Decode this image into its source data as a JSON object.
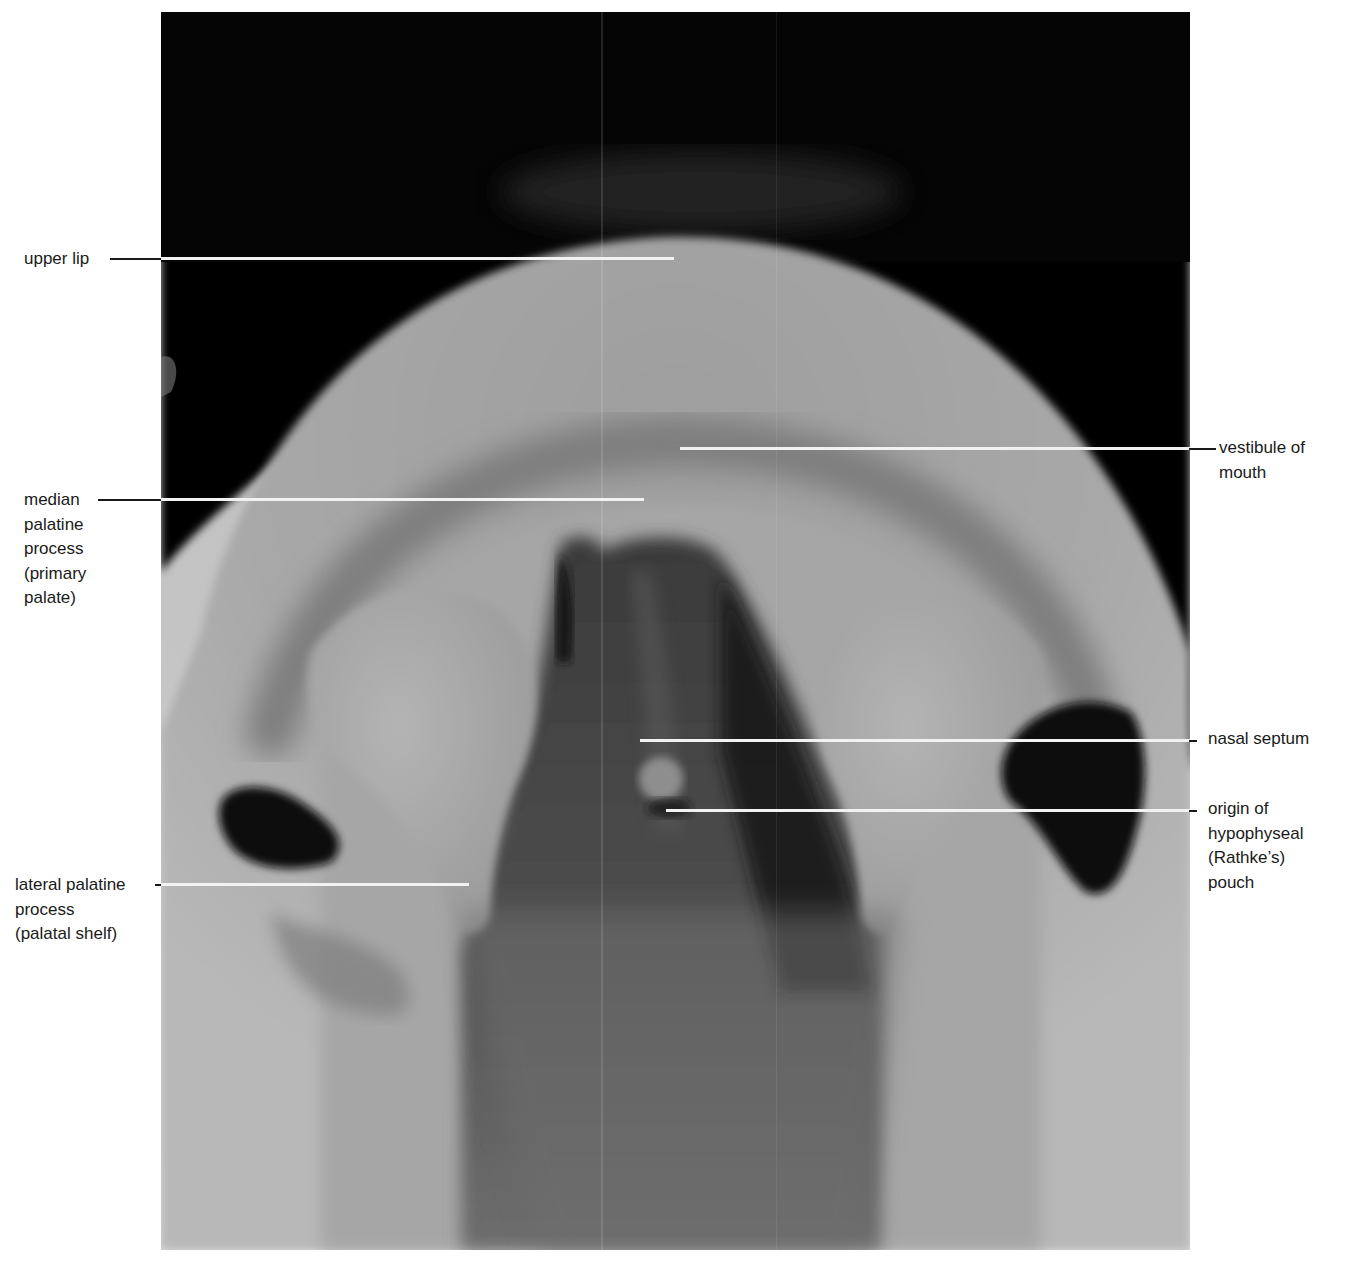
{
  "figure": {
    "labels_left": [
      {
        "id": "upper-lip",
        "lines": [
          "upper lip"
        ]
      },
      {
        "id": "median-palatine-process",
        "lines": [
          "median",
          "palatine",
          "process",
          "(primary",
          "palate)"
        ]
      },
      {
        "id": "lateral-palatine-process",
        "lines": [
          "lateral palatine",
          "process",
          "(palatal shelf)"
        ]
      }
    ],
    "labels_right": [
      {
        "id": "vestibule-of-mouth",
        "lines": [
          "vestibule of",
          "mouth"
        ]
      },
      {
        "id": "nasal-septum",
        "lines": [
          "nasal septum"
        ]
      },
      {
        "id": "origin-of-hypophyseal-pouch",
        "lines": [
          "origin of",
          "hypophyseal",
          "(Rathke’s)",
          "pouch"
        ]
      }
    ],
    "colors": {
      "background": "#ffffff",
      "text": "#1a1a1a",
      "leader_line_on_photo": "#f2f2f2",
      "photo_dark": "#050505",
      "photo_mid": "#8a8a8a",
      "photo_light": "#d6d6d6"
    }
  }
}
